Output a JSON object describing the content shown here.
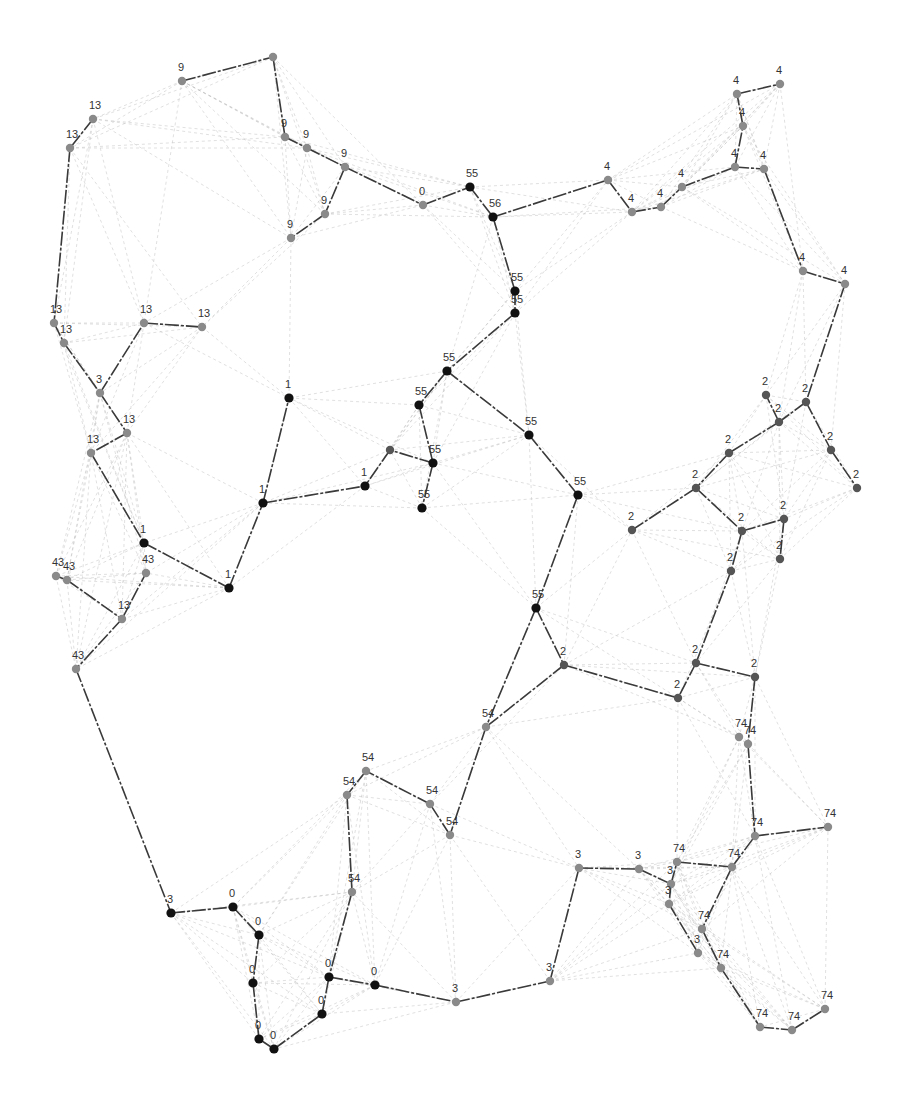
{
  "diagram": {
    "type": "network-graph",
    "colors": {
      "background": "#ffffff",
      "tree_edge": "#3a3a3a",
      "background_edge": "#b8b8b8",
      "node_dark": "#111111",
      "node_mid": "#555555",
      "node_light": "#8a8a8a",
      "label": "#333333"
    },
    "nodes": [
      {
        "id": "n1",
        "x": 182,
        "y": 81,
        "label": "9",
        "tone": "light"
      },
      {
        "id": "n2",
        "x": 273,
        "y": 57,
        "label": "",
        "tone": "light"
      },
      {
        "id": "n3",
        "x": 93,
        "y": 119,
        "label": "13",
        "tone": "light"
      },
      {
        "id": "n4",
        "x": 70,
        "y": 148,
        "label": "13",
        "tone": "light"
      },
      {
        "id": "n5",
        "x": 285,
        "y": 137,
        "label": "9",
        "tone": "light"
      },
      {
        "id": "n6",
        "x": 307,
        "y": 148,
        "label": "9",
        "tone": "light"
      },
      {
        "id": "n7",
        "x": 345,
        "y": 167,
        "label": "9",
        "tone": "light"
      },
      {
        "id": "n8",
        "x": 325,
        "y": 214,
        "label": "9",
        "tone": "light"
      },
      {
        "id": "n9",
        "x": 291,
        "y": 238,
        "label": "9",
        "tone": "light"
      },
      {
        "id": "n10",
        "x": 423,
        "y": 205,
        "label": "0",
        "tone": "light"
      },
      {
        "id": "n11",
        "x": 470,
        "y": 187,
        "label": "55",
        "tone": "dark"
      },
      {
        "id": "n12",
        "x": 493,
        "y": 217,
        "label": "56",
        "tone": "dark"
      },
      {
        "id": "n13",
        "x": 515,
        "y": 291,
        "label": "55",
        "tone": "dark"
      },
      {
        "id": "n14",
        "x": 515,
        "y": 313,
        "label": "55",
        "tone": "dark"
      },
      {
        "id": "n15",
        "x": 447,
        "y": 371,
        "label": "55",
        "tone": "dark"
      },
      {
        "id": "n16",
        "x": 419,
        "y": 405,
        "label": "55",
        "tone": "dark"
      },
      {
        "id": "n17",
        "x": 433,
        "y": 463,
        "label": "55",
        "tone": "dark"
      },
      {
        "id": "n18",
        "x": 422,
        "y": 508,
        "label": "55",
        "tone": "dark"
      },
      {
        "id": "n19",
        "x": 529,
        "y": 435,
        "label": "55",
        "tone": "dark"
      },
      {
        "id": "n20",
        "x": 578,
        "y": 495,
        "label": "55",
        "tone": "dark"
      },
      {
        "id": "n21",
        "x": 390,
        "y": 450,
        "label": "",
        "tone": "mid"
      },
      {
        "id": "n22",
        "x": 608,
        "y": 180,
        "label": "4",
        "tone": "light"
      },
      {
        "id": "n23",
        "x": 632,
        "y": 212,
        "label": "4",
        "tone": "light"
      },
      {
        "id": "n24",
        "x": 661,
        "y": 207,
        "label": "4",
        "tone": "light"
      },
      {
        "id": "n25",
        "x": 682,
        "y": 187,
        "label": "4",
        "tone": "light"
      },
      {
        "id": "n26",
        "x": 737,
        "y": 94,
        "label": "4",
        "tone": "light"
      },
      {
        "id": "n27",
        "x": 780,
        "y": 84,
        "label": "4",
        "tone": "light"
      },
      {
        "id": "n28",
        "x": 743,
        "y": 126,
        "label": "4",
        "tone": "light"
      },
      {
        "id": "n29",
        "x": 735,
        "y": 167,
        "label": "4",
        "tone": "light"
      },
      {
        "id": "n30",
        "x": 764,
        "y": 169,
        "label": "4",
        "tone": "light"
      },
      {
        "id": "n31",
        "x": 803,
        "y": 271,
        "label": "4",
        "tone": "light"
      },
      {
        "id": "n32",
        "x": 845,
        "y": 284,
        "label": "4",
        "tone": "light"
      },
      {
        "id": "n33",
        "x": 54,
        "y": 323,
        "label": "13",
        "tone": "light"
      },
      {
        "id": "n34",
        "x": 64,
        "y": 343,
        "label": "13",
        "tone": "light"
      },
      {
        "id": "n35",
        "x": 144,
        "y": 323,
        "label": "13",
        "tone": "light"
      },
      {
        "id": "n36",
        "x": 202,
        "y": 327,
        "label": "13",
        "tone": "light"
      },
      {
        "id": "n37",
        "x": 100,
        "y": 393,
        "label": "3",
        "tone": "light"
      },
      {
        "id": "n38",
        "x": 127,
        "y": 433,
        "label": "13",
        "tone": "light"
      },
      {
        "id": "n39",
        "x": 91,
        "y": 453,
        "label": "13",
        "tone": "light"
      },
      {
        "id": "n40",
        "x": 289,
        "y": 398,
        "label": "1",
        "tone": "dark"
      },
      {
        "id": "n41",
        "x": 263,
        "y": 503,
        "label": "1",
        "tone": "dark"
      },
      {
        "id": "n42",
        "x": 365,
        "y": 486,
        "label": "1",
        "tone": "dark"
      },
      {
        "id": "n43",
        "x": 144,
        "y": 543,
        "label": "1",
        "tone": "dark"
      },
      {
        "id": "n44",
        "x": 229,
        "y": 588,
        "label": "1",
        "tone": "dark"
      },
      {
        "id": "n45",
        "x": 56,
        "y": 576,
        "label": "43",
        "tone": "light"
      },
      {
        "id": "n46",
        "x": 67,
        "y": 580,
        "label": "43",
        "tone": "light"
      },
      {
        "id": "n47",
        "x": 146,
        "y": 573,
        "label": "43",
        "tone": "light"
      },
      {
        "id": "n48",
        "x": 122,
        "y": 619,
        "label": "13",
        "tone": "light"
      },
      {
        "id": "n49",
        "x": 76,
        "y": 669,
        "label": "43",
        "tone": "light"
      },
      {
        "id": "n50",
        "x": 766,
        "y": 395,
        "label": "2",
        "tone": "mid"
      },
      {
        "id": "n51",
        "x": 806,
        "y": 402,
        "label": "2",
        "tone": "mid"
      },
      {
        "id": "n52",
        "x": 779,
        "y": 422,
        "label": "2",
        "tone": "mid"
      },
      {
        "id": "n53",
        "x": 831,
        "y": 450,
        "label": "2",
        "tone": "mid"
      },
      {
        "id": "n54",
        "x": 857,
        "y": 488,
        "label": "2",
        "tone": "mid"
      },
      {
        "id": "n55",
        "x": 729,
        "y": 453,
        "label": "2",
        "tone": "mid"
      },
      {
        "id": "n56",
        "x": 696,
        "y": 488,
        "label": "2",
        "tone": "mid"
      },
      {
        "id": "n57",
        "x": 632,
        "y": 530,
        "label": "2",
        "tone": "mid"
      },
      {
        "id": "n58",
        "x": 742,
        "y": 531,
        "label": "2",
        "tone": "mid"
      },
      {
        "id": "n59",
        "x": 784,
        "y": 519,
        "label": "2",
        "tone": "mid"
      },
      {
        "id": "n60",
        "x": 780,
        "y": 559,
        "label": "2",
        "tone": "mid"
      },
      {
        "id": "n61",
        "x": 731,
        "y": 571,
        "label": "2",
        "tone": "mid"
      },
      {
        "id": "n62",
        "x": 536,
        "y": 608,
        "label": "55",
        "tone": "dark"
      },
      {
        "id": "n63",
        "x": 564,
        "y": 665,
        "label": "2",
        "tone": "mid"
      },
      {
        "id": "n64",
        "x": 696,
        "y": 663,
        "label": "2",
        "tone": "mid"
      },
      {
        "id": "n65",
        "x": 755,
        "y": 677,
        "label": "2",
        "tone": "mid"
      },
      {
        "id": "n66",
        "x": 678,
        "y": 698,
        "label": "2",
        "tone": "mid"
      },
      {
        "id": "n67",
        "x": 739,
        "y": 737,
        "label": "74",
        "tone": "light"
      },
      {
        "id": "n68",
        "x": 748,
        "y": 744,
        "label": "74",
        "tone": "light"
      },
      {
        "id": "n69",
        "x": 486,
        "y": 727,
        "label": "54",
        "tone": "light"
      },
      {
        "id": "n70",
        "x": 366,
        "y": 771,
        "label": "54",
        "tone": "light"
      },
      {
        "id": "n71",
        "x": 347,
        "y": 795,
        "label": "54",
        "tone": "light"
      },
      {
        "id": "n72",
        "x": 430,
        "y": 804,
        "label": "54",
        "tone": "light"
      },
      {
        "id": "n73",
        "x": 450,
        "y": 835,
        "label": "54",
        "tone": "light"
      },
      {
        "id": "n74",
        "x": 352,
        "y": 892,
        "label": "54",
        "tone": "light"
      },
      {
        "id": "n75",
        "x": 755,
        "y": 836,
        "label": "74",
        "tone": "light"
      },
      {
        "id": "n76",
        "x": 828,
        "y": 827,
        "label": "74",
        "tone": "light"
      },
      {
        "id": "n77",
        "x": 579,
        "y": 868,
        "label": "3",
        "tone": "light"
      },
      {
        "id": "n78",
        "x": 639,
        "y": 869,
        "label": "3",
        "tone": "light"
      },
      {
        "id": "n79",
        "x": 677,
        "y": 862,
        "label": "74",
        "tone": "light"
      },
      {
        "id": "n80",
        "x": 732,
        "y": 867,
        "label": "74",
        "tone": "light"
      },
      {
        "id": "n81",
        "x": 671,
        "y": 884,
        "label": "3",
        "tone": "light"
      },
      {
        "id": "n82",
        "x": 669,
        "y": 904,
        "label": "3",
        "tone": "light"
      },
      {
        "id": "n83",
        "x": 702,
        "y": 929,
        "label": "74",
        "tone": "light"
      },
      {
        "id": "n84",
        "x": 698,
        "y": 953,
        "label": "3",
        "tone": "light"
      },
      {
        "id": "n85",
        "x": 721,
        "y": 968,
        "label": "74",
        "tone": "light"
      },
      {
        "id": "n86",
        "x": 825,
        "y": 1009,
        "label": "74",
        "tone": "light"
      },
      {
        "id": "n87",
        "x": 760,
        "y": 1027,
        "label": "74",
        "tone": "light"
      },
      {
        "id": "n88",
        "x": 792,
        "y": 1030,
        "label": "74",
        "tone": "light"
      },
      {
        "id": "n89",
        "x": 171,
        "y": 913,
        "label": "3",
        "tone": "dark"
      },
      {
        "id": "n90",
        "x": 233,
        "y": 907,
        "label": "0",
        "tone": "dark"
      },
      {
        "id": "n91",
        "x": 259,
        "y": 935,
        "label": "0",
        "tone": "dark"
      },
      {
        "id": "n92",
        "x": 253,
        "y": 983,
        "label": "0",
        "tone": "dark"
      },
      {
        "id": "n93",
        "x": 329,
        "y": 977,
        "label": "0",
        "tone": "dark"
      },
      {
        "id": "n94",
        "x": 375,
        "y": 985,
        "label": "0",
        "tone": "dark"
      },
      {
        "id": "n95",
        "x": 322,
        "y": 1014,
        "label": "0",
        "tone": "dark"
      },
      {
        "id": "n96",
        "x": 259,
        "y": 1039,
        "label": "0",
        "tone": "dark"
      },
      {
        "id": "n97",
        "x": 274,
        "y": 1049,
        "label": "0",
        "tone": "dark"
      },
      {
        "id": "n98",
        "x": 456,
        "y": 1002,
        "label": "3",
        "tone": "light"
      },
      {
        "id": "n99",
        "x": 550,
        "y": 981,
        "label": "3",
        "tone": "light"
      }
    ],
    "tree_edges": [
      [
        "n1",
        "n2"
      ],
      [
        "n2",
        "n5"
      ],
      [
        "n5",
        "n6"
      ],
      [
        "n6",
        "n7"
      ],
      [
        "n7",
        "n10"
      ],
      [
        "n7",
        "n8"
      ],
      [
        "n8",
        "n9"
      ],
      [
        "n10",
        "n11"
      ],
      [
        "n11",
        "n12"
      ],
      [
        "n12",
        "n22"
      ],
      [
        "n12",
        "n13"
      ],
      [
        "n13",
        "n14"
      ],
      [
        "n14",
        "n15"
      ],
      [
        "n15",
        "n16"
      ],
      [
        "n16",
        "n17"
      ],
      [
        "n15",
        "n19"
      ],
      [
        "n19",
        "n20"
      ],
      [
        "n17",
        "n18"
      ],
      [
        "n17",
        "n21"
      ],
      [
        "n21",
        "n42"
      ],
      [
        "n22",
        "n23"
      ],
      [
        "n23",
        "n24"
      ],
      [
        "n24",
        "n25"
      ],
      [
        "n25",
        "n29"
      ],
      [
        "n29",
        "n30"
      ],
      [
        "n29",
        "n28"
      ],
      [
        "n28",
        "n26"
      ],
      [
        "n26",
        "n27"
      ],
      [
        "n30",
        "n31"
      ],
      [
        "n31",
        "n32"
      ],
      [
        "n32",
        "n51"
      ],
      [
        "n3",
        "n4"
      ],
      [
        "n4",
        "n33"
      ],
      [
        "n33",
        "n34"
      ],
      [
        "n34",
        "n37"
      ],
      [
        "n37",
        "n35"
      ],
      [
        "n35",
        "n36"
      ],
      [
        "n37",
        "n38"
      ],
      [
        "n38",
        "n39"
      ],
      [
        "n39",
        "n43"
      ],
      [
        "n43",
        "n44"
      ],
      [
        "n44",
        "n41"
      ],
      [
        "n41",
        "n40"
      ],
      [
        "n41",
        "n42"
      ],
      [
        "n45",
        "n46"
      ],
      [
        "n46",
        "n48"
      ],
      [
        "n48",
        "n47"
      ],
      [
        "n48",
        "n49"
      ],
      [
        "n49",
        "n89"
      ],
      [
        "n51",
        "n52"
      ],
      [
        "n52",
        "n50"
      ],
      [
        "n52",
        "n55"
      ],
      [
        "n51",
        "n53"
      ],
      [
        "n53",
        "n54"
      ],
      [
        "n55",
        "n56"
      ],
      [
        "n56",
        "n57"
      ],
      [
        "n56",
        "n58"
      ],
      [
        "n58",
        "n59"
      ],
      [
        "n59",
        "n60"
      ],
      [
        "n58",
        "n61"
      ],
      [
        "n61",
        "n64"
      ],
      [
        "n64",
        "n65"
      ],
      [
        "n64",
        "n66"
      ],
      [
        "n66",
        "n63"
      ],
      [
        "n65",
        "n68"
      ],
      [
        "n68",
        "n75"
      ],
      [
        "n75",
        "n76"
      ],
      [
        "n20",
        "n62"
      ],
      [
        "n62",
        "n63"
      ],
      [
        "n62",
        "n69"
      ],
      [
        "n63",
        "n69"
      ],
      [
        "n69",
        "n73"
      ],
      [
        "n73",
        "n72"
      ],
      [
        "n72",
        "n70"
      ],
      [
        "n70",
        "n71"
      ],
      [
        "n71",
        "n74"
      ],
      [
        "n74",
        "n93"
      ],
      [
        "n77",
        "n78"
      ],
      [
        "n78",
        "n81"
      ],
      [
        "n81",
        "n79"
      ],
      [
        "n79",
        "n80"
      ],
      [
        "n80",
        "n75"
      ],
      [
        "n80",
        "n83"
      ],
      [
        "n81",
        "n82"
      ],
      [
        "n82",
        "n84"
      ],
      [
        "n83",
        "n85"
      ],
      [
        "n85",
        "n87"
      ],
      [
        "n87",
        "n88"
      ],
      [
        "n88",
        "n86"
      ],
      [
        "n77",
        "n99"
      ],
      [
        "n89",
        "n90"
      ],
      [
        "n90",
        "n91"
      ],
      [
        "n91",
        "n92"
      ],
      [
        "n92",
        "n96"
      ],
      [
        "n96",
        "n97"
      ],
      [
        "n97",
        "n95"
      ],
      [
        "n95",
        "n93"
      ],
      [
        "n93",
        "n94"
      ],
      [
        "n94",
        "n98"
      ],
      [
        "n98",
        "n99"
      ]
    ]
  }
}
